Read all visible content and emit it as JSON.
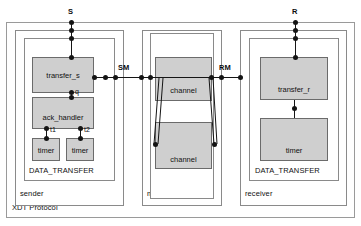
{
  "diagram": {
    "title": "XDT Protocol",
    "type": "component-architecture",
    "outer_frame_label": "XDT Protocol",
    "components": {
      "sender": {
        "label": "sender",
        "inner_label": "DATA_TRANSFER",
        "blocks": [
          {
            "label": "transfer_s"
          },
          {
            "label": "ack_handler"
          },
          {
            "label": "timer"
          },
          {
            "label": "timer"
          }
        ]
      },
      "medium": {
        "label": "medium",
        "blocks": [
          {
            "label": "channel"
          },
          {
            "label": "channel"
          }
        ]
      },
      "receiver": {
        "label": "receiver",
        "inner_label": "DATA_TRANSFER",
        "blocks": [
          {
            "label": "transfer_r"
          },
          {
            "label": "timer"
          }
        ]
      }
    },
    "ports": [
      {
        "name": "S",
        "label": "S"
      },
      {
        "name": "R",
        "label": "R"
      },
      {
        "name": "SM",
        "label": "SM"
      },
      {
        "name": "RM",
        "label": "RM"
      }
    ],
    "signals": [
      {
        "name": "q",
        "label": "q"
      },
      {
        "name": "t1",
        "label": "t1"
      },
      {
        "name": "t2",
        "label": "t2"
      }
    ],
    "colors": {
      "block_fill": "#cfcfcf",
      "block_stroke": "#6b6b6b",
      "frame_stroke": "#8a8a8a",
      "wire": "#151515",
      "text": "#111111",
      "background": "#ffffff"
    }
  }
}
